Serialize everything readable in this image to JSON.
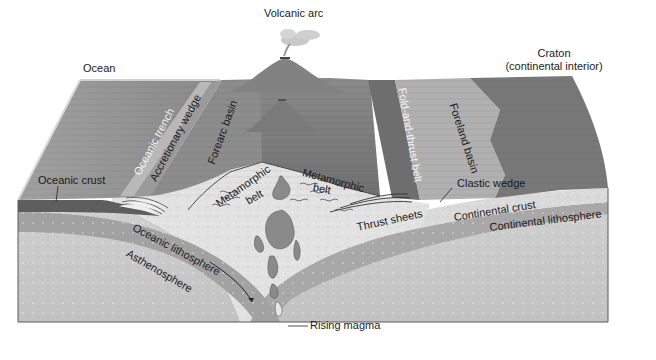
{
  "figure": {
    "type": "block diagram"
  },
  "labels": {
    "volcanic_arc": "Volcanic arc",
    "ocean": "Ocean",
    "craton_line1": "Craton",
    "craton_line2": "(continental interior)",
    "oceanic_trench": "Oceanic trench",
    "accretionary_wedge": "Accretionary wedge",
    "forearc_basin": "Forearc basin",
    "fold_and_thrust_belt": "Fold-and-thrust belt",
    "foreland_basin": "Foreland basin",
    "oceanic_crust": "Oceanic crust",
    "metamorphic_belt_left_1": "Metamorphic",
    "metamorphic_belt_left_2": "belt",
    "metamorphic_belt_right_1": "Metamorphic",
    "metamorphic_belt_right_2": "belt",
    "clastic_wedge": "Clastic wedge",
    "thrust_sheets": "Thrust sheets",
    "continental_crust": "Continental crust",
    "continental_lithosphere": "Continental lithosphere",
    "oceanic_lithosphere": "Oceanic lithosphere",
    "asthenosphere": "Asthenosphere",
    "rising_magma": "Rising magma"
  },
  "colors": {
    "background": "#ffffff",
    "ocean_surface": "#8e8e8e",
    "land_surface": "#7c7c7c",
    "foreland_light": "#b4b4b4",
    "craton": "#767676",
    "oceanic_crust": "#6a6a6a",
    "lithosphere": "#a6a6a6",
    "asthenosphere": "#c9c9c9",
    "continental_crust": "#dcdcdc",
    "magma": "#8a8a8a",
    "outline": "#4a4a4a"
  }
}
